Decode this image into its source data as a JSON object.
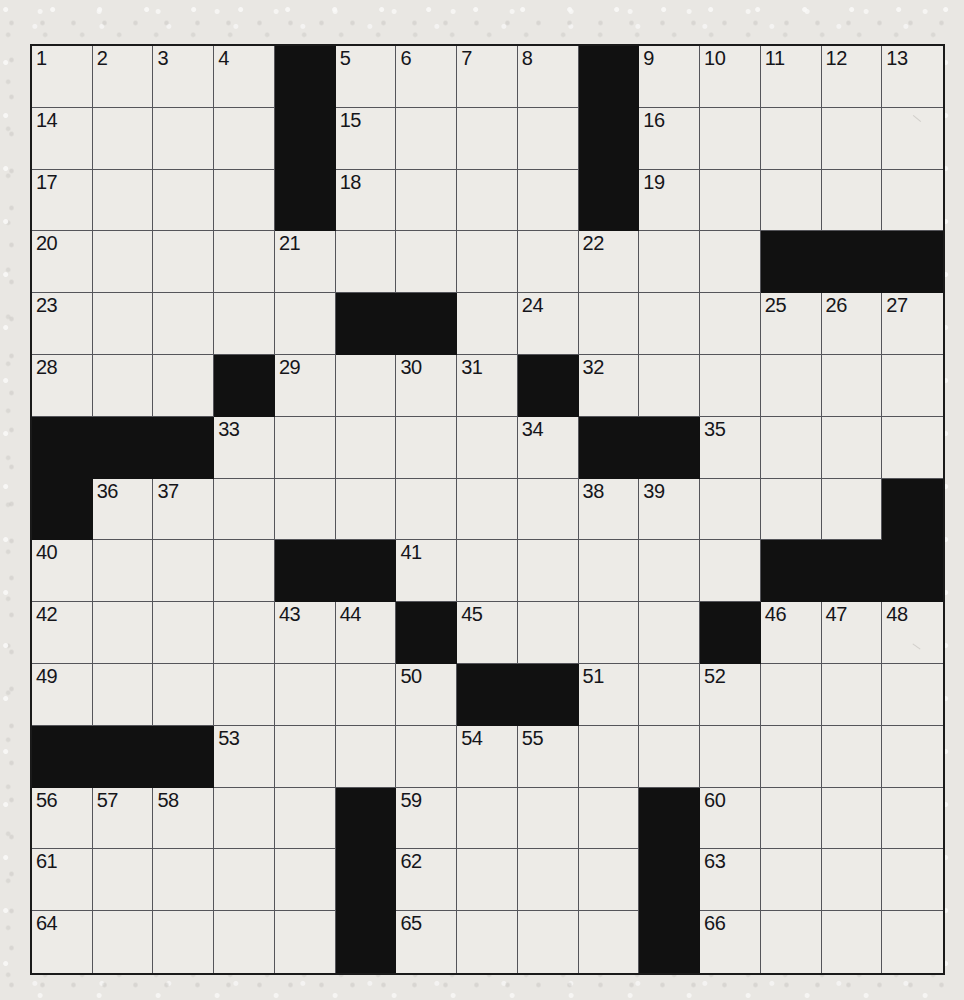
{
  "puzzle": {
    "type": "crossword-grid",
    "rows": 15,
    "cols": 15,
    "grid_colors": {
      "paper": "#e9e7e3",
      "cell": "#edebe7",
      "block": "#111111",
      "rule": "#55555a",
      "border": "#1a1a1a",
      "number": "#15151a"
    },
    "blocks": [
      [
        0,
        4
      ],
      [
        0,
        9
      ],
      [
        1,
        4
      ],
      [
        1,
        9
      ],
      [
        2,
        4
      ],
      [
        2,
        9
      ],
      [
        3,
        12
      ],
      [
        3,
        13
      ],
      [
        3,
        14
      ],
      [
        4,
        5
      ],
      [
        4,
        6
      ],
      [
        5,
        3
      ],
      [
        5,
        8
      ],
      [
        6,
        0
      ],
      [
        6,
        1
      ],
      [
        6,
        2
      ],
      [
        6,
        9
      ],
      [
        6,
        10
      ],
      [
        7,
        0
      ],
      [
        7,
        14
      ],
      [
        8,
        4
      ],
      [
        8,
        5
      ],
      [
        8,
        12
      ],
      [
        8,
        13
      ],
      [
        8,
        14
      ],
      [
        9,
        6
      ],
      [
        9,
        11
      ],
      [
        10,
        7
      ],
      [
        10,
        8
      ],
      [
        11,
        0
      ],
      [
        11,
        1
      ],
      [
        11,
        2
      ],
      [
        12,
        5
      ],
      [
        12,
        10
      ],
      [
        13,
        5
      ],
      [
        13,
        10
      ],
      [
        14,
        5
      ],
      [
        14,
        10
      ]
    ],
    "numbers": [
      {
        "row": 0,
        "col": 0,
        "n": "1"
      },
      {
        "row": 0,
        "col": 1,
        "n": "2"
      },
      {
        "row": 0,
        "col": 2,
        "n": "3"
      },
      {
        "row": 0,
        "col": 3,
        "n": "4"
      },
      {
        "row": 0,
        "col": 5,
        "n": "5"
      },
      {
        "row": 0,
        "col": 6,
        "n": "6"
      },
      {
        "row": 0,
        "col": 7,
        "n": "7"
      },
      {
        "row": 0,
        "col": 8,
        "n": "8"
      },
      {
        "row": 0,
        "col": 10,
        "n": "9"
      },
      {
        "row": 0,
        "col": 11,
        "n": "10"
      },
      {
        "row": 0,
        "col": 12,
        "n": "11"
      },
      {
        "row": 0,
        "col": 13,
        "n": "12"
      },
      {
        "row": 0,
        "col": 14,
        "n": "13"
      },
      {
        "row": 1,
        "col": 0,
        "n": "14"
      },
      {
        "row": 1,
        "col": 5,
        "n": "15"
      },
      {
        "row": 1,
        "col": 10,
        "n": "16"
      },
      {
        "row": 2,
        "col": 0,
        "n": "17"
      },
      {
        "row": 2,
        "col": 5,
        "n": "18"
      },
      {
        "row": 2,
        "col": 10,
        "n": "19"
      },
      {
        "row": 3,
        "col": 0,
        "n": "20"
      },
      {
        "row": 3,
        "col": 4,
        "n": "21"
      },
      {
        "row": 3,
        "col": 9,
        "n": "22"
      },
      {
        "row": 4,
        "col": 0,
        "n": "23"
      },
      {
        "row": 4,
        "col": 8,
        "n": "24"
      },
      {
        "row": 4,
        "col": 12,
        "n": "25"
      },
      {
        "row": 4,
        "col": 13,
        "n": "26"
      },
      {
        "row": 4,
        "col": 14,
        "n": "27"
      },
      {
        "row": 5,
        "col": 0,
        "n": "28"
      },
      {
        "row": 5,
        "col": 4,
        "n": "29"
      },
      {
        "row": 5,
        "col": 6,
        "n": "30"
      },
      {
        "row": 5,
        "col": 7,
        "n": "31"
      },
      {
        "row": 5,
        "col": 9,
        "n": "32"
      },
      {
        "row": 6,
        "col": 3,
        "n": "33"
      },
      {
        "row": 6,
        "col": 8,
        "n": "34"
      },
      {
        "row": 6,
        "col": 11,
        "n": "35"
      },
      {
        "row": 7,
        "col": 1,
        "n": "36"
      },
      {
        "row": 7,
        "col": 2,
        "n": "37"
      },
      {
        "row": 7,
        "col": 9,
        "n": "38"
      },
      {
        "row": 7,
        "col": 10,
        "n": "39"
      },
      {
        "row": 8,
        "col": 0,
        "n": "40"
      },
      {
        "row": 8,
        "col": 6,
        "n": "41"
      },
      {
        "row": 9,
        "col": 0,
        "n": "42"
      },
      {
        "row": 9,
        "col": 4,
        "n": "43"
      },
      {
        "row": 9,
        "col": 5,
        "n": "44"
      },
      {
        "row": 9,
        "col": 7,
        "n": "45"
      },
      {
        "row": 9,
        "col": 12,
        "n": "46"
      },
      {
        "row": 9,
        "col": 13,
        "n": "47"
      },
      {
        "row": 9,
        "col": 14,
        "n": "48"
      },
      {
        "row": 10,
        "col": 0,
        "n": "49"
      },
      {
        "row": 10,
        "col": 6,
        "n": "50"
      },
      {
        "row": 10,
        "col": 9,
        "n": "51"
      },
      {
        "row": 10,
        "col": 11,
        "n": "52"
      },
      {
        "row": 11,
        "col": 3,
        "n": "53"
      },
      {
        "row": 11,
        "col": 7,
        "n": "54"
      },
      {
        "row": 11,
        "col": 8,
        "n": "55"
      },
      {
        "row": 12,
        "col": 0,
        "n": "56"
      },
      {
        "row": 12,
        "col": 1,
        "n": "57"
      },
      {
        "row": 12,
        "col": 2,
        "n": "58"
      },
      {
        "row": 12,
        "col": 6,
        "n": "59"
      },
      {
        "row": 12,
        "col": 11,
        "n": "60"
      },
      {
        "row": 13,
        "col": 0,
        "n": "61"
      },
      {
        "row": 13,
        "col": 6,
        "n": "62"
      },
      {
        "row": 13,
        "col": 11,
        "n": "63"
      },
      {
        "row": 14,
        "col": 0,
        "n": "64"
      },
      {
        "row": 14,
        "col": 6,
        "n": "65"
      },
      {
        "row": 14,
        "col": 11,
        "n": "66"
      }
    ]
  }
}
